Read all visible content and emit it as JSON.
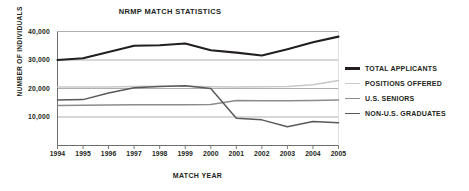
{
  "chart_data": {
    "type": "line",
    "title": "NRMP MATCH STATISTICS",
    "xlabel": "MATCH YEAR",
    "ylabel": "NUMBER OF INDIVIDUALS",
    "x": [
      1994,
      1995,
      1996,
      1997,
      1998,
      1999,
      2000,
      2001,
      2002,
      2003,
      2004,
      2005
    ],
    "categories": [
      "1994",
      "1995",
      "1996",
      "1997",
      "1998",
      "1999",
      "2000",
      "2001",
      "2002",
      "2003",
      "2004",
      "2005"
    ],
    "xlim": [
      1994,
      2005
    ],
    "ylim": [
      0,
      40000
    ],
    "yticks": [
      10000,
      20000,
      30000,
      40000
    ],
    "ytick_labels": [
      "10,000",
      "20,000",
      "30,000",
      "40,000"
    ],
    "grid": true,
    "legend_position": "right",
    "series": [
      {
        "name": "TOTAL APPLICANTS",
        "color": "#231f20",
        "width": 2.1,
        "values": [
          30000,
          30600,
          32800,
          35000,
          35200,
          35800,
          33400,
          32600,
          31600,
          33800,
          36200,
          38200
        ]
      },
      {
        "name": "POSITIONS OFFERED",
        "color": "#c8c8c8",
        "width": 1.5,
        "values": [
          20500,
          20500,
          20500,
          20700,
          20800,
          20800,
          20600,
          20500,
          20600,
          20700,
          21300,
          22800
        ]
      },
      {
        "name": "U.S. SENIORS",
        "color": "#8c8c8c",
        "width": 1.5,
        "values": [
          14000,
          14100,
          14200,
          14300,
          14300,
          14300,
          14400,
          15800,
          15700,
          15700,
          15800,
          16000
        ]
      },
      {
        "name": "NON-U.S. GRADUATES",
        "color": "#595959",
        "width": 1.5,
        "values": [
          16000,
          16100,
          18400,
          20300,
          20700,
          21000,
          20000,
          9600,
          9000,
          6600,
          8400,
          8000
        ]
      }
    ]
  }
}
